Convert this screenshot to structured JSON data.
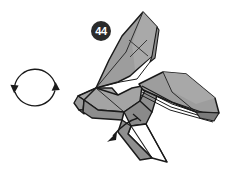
{
  "figure": {
    "kind": "origami-folding-step-diagram",
    "background_color": "#ffffff"
  },
  "step": {
    "number": "44",
    "badge_fill": "#2b2b2b",
    "badge_text_color": "#ffffff",
    "badge_center": {
      "x": 101,
      "y": 31
    },
    "badge_radius": 10
  },
  "symbols": {
    "rotate_symbol": {
      "label": "rotate-180-symbol",
      "center": {
        "x": 35,
        "y": 88
      },
      "radius": 21,
      "stroke": "#1a1a1a",
      "arrowheads": [
        {
          "name": "left-arrowhead-down",
          "direction": "down",
          "x": 14,
          "y": 90
        },
        {
          "name": "right-arrowhead-up",
          "direction": "up",
          "x": 56,
          "y": 86
        }
      ]
    },
    "fold_arrow": {
      "label": "pull-down-left-arrow",
      "from": {
        "x": 137,
        "y": 119
      },
      "to": {
        "x": 110,
        "y": 140
      },
      "stroke": "#1a1a1a"
    }
  },
  "palette": {
    "paper_front": "#9d9d9d",
    "paper_front_light": "#b0b0b0",
    "paper_front_mid": "#949494",
    "paper_shadow": "#7e7e7e",
    "paper_dark": "#6f6f6f",
    "paper_back": "#ffffff",
    "outline": "#1a1a1a",
    "crease": "#3a3a3a"
  },
  "parts": [
    {
      "name": "upper-wing",
      "fill": "#9d9d9d",
      "note": "large raised wing at top right with X crease"
    },
    {
      "name": "upper-wing-edge-strip",
      "fill": "#8a8a8a",
      "note": "thin folded edge band along wing right side"
    },
    {
      "name": "upper-wing-x-crease",
      "note": "thin X shaped crease mark on upper wing"
    },
    {
      "name": "head-snout",
      "fill": "#a4a4a4",
      "note": "pointed head at left"
    },
    {
      "name": "body-top-facet",
      "fill": "#a8a8a8"
    },
    {
      "name": "body-side-facet",
      "fill": "#8e8e8e"
    },
    {
      "name": "right-wing",
      "fill": "#9d9d9d",
      "note": "wing sweeping to the right"
    },
    {
      "name": "right-wing-pleats",
      "note": "stack of parallel layer lines under right wing"
    },
    {
      "name": "lower-leg-flap",
      "fill": "#ffffff",
      "note": "white reverse-side triangular flap at bottom"
    },
    {
      "name": "lower-dark-facet",
      "fill": "#7c7c7c"
    }
  ]
}
